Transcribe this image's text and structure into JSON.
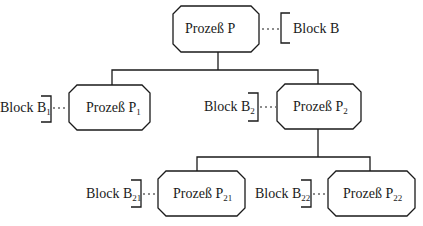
{
  "diagram": {
    "type": "process-tree",
    "nodes": [
      {
        "id": "P",
        "label": "Prozeß P",
        "sub": "",
        "block": "Block B",
        "block_sub": ""
      },
      {
        "id": "P1",
        "label": "Prozeß P",
        "sub": "1",
        "block": "Block B",
        "block_sub": "1"
      },
      {
        "id": "P2",
        "label": "Prozeß P",
        "sub": "2",
        "block": "Block B",
        "block_sub": "2"
      },
      {
        "id": "P21",
        "label": "Prozeß P",
        "sub": "21",
        "block": "Block B",
        "block_sub": "21"
      },
      {
        "id": "P22",
        "label": "Prozeß P",
        "sub": "22",
        "block": "Block B",
        "block_sub": "22"
      }
    ],
    "edges": [
      [
        "P",
        "P1"
      ],
      [
        "P",
        "P2"
      ],
      [
        "P2",
        "P21"
      ],
      [
        "P2",
        "P22"
      ]
    ],
    "colors": {
      "stroke": "#1a1a1a",
      "background": "#ffffff"
    }
  }
}
